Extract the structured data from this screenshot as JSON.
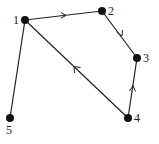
{
  "diagram": {
    "type": "directed-graph",
    "nodes": [
      {
        "id": "1",
        "label": "1",
        "x": 25,
        "y": 20,
        "lx": 13,
        "ly": 24
      },
      {
        "id": "2",
        "label": "2",
        "x": 102,
        "y": 11,
        "lx": 108,
        "ly": 15
      },
      {
        "id": "3",
        "label": "3",
        "x": 137,
        "y": 58,
        "lx": 143,
        "ly": 62
      },
      {
        "id": "4",
        "label": "4",
        "x": 128,
        "y": 118,
        "lx": 134,
        "ly": 122
      },
      {
        "id": "5",
        "label": "5",
        "x": 10,
        "y": 118,
        "lx": 6,
        "ly": 134
      }
    ],
    "edges": [
      {
        "from": "1",
        "to": "2",
        "directed": true
      },
      {
        "from": "2",
        "to": "3",
        "directed": true
      },
      {
        "from": "4",
        "to": "3",
        "directed": true
      },
      {
        "from": "4",
        "to": "1",
        "directed": true
      },
      {
        "from": "1",
        "to": "5",
        "directed": false
      }
    ]
  }
}
